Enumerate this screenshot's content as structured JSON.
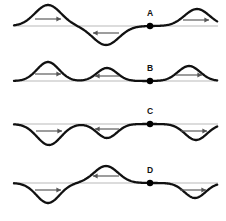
{
  "figure": {
    "title": "",
    "width": 226,
    "height": 221,
    "background_color": "#ffffff",
    "wave_color": "#111111",
    "axis_color": "#b9b9b9",
    "arrow_color": "#555555",
    "marker_color": "#000000"
  },
  "chart_data": {
    "type": "line",
    "title": "",
    "subtitle": "",
    "xlabel": "",
    "ylabel": "",
    "grid": false,
    "legend": null,
    "xlim": [
      0,
      226
    ],
    "ylim": [
      0,
      221
    ],
    "rows": [
      {
        "label": "A",
        "baseline_y": 26,
        "marker": {
          "x": 150,
          "y": 26,
          "label_x": 150,
          "label_y": 16
        },
        "pulses": [
          {
            "center_x": 48,
            "amplitude": 21,
            "direction": "up",
            "half_width": 26,
            "arrow": {
              "direction": "right",
              "x": 48,
              "y": 19,
              "length": 26
            }
          },
          {
            "center_x": 106,
            "amplitude": 19,
            "direction": "down",
            "half_width": 26,
            "arrow": {
              "direction": "left",
              "x": 106,
              "y": 33,
              "length": 26
            }
          },
          {
            "center_x": 197,
            "amplitude": 17,
            "direction": "up",
            "half_width": 25,
            "arrow": {
              "direction": "right",
              "x": 196,
              "y": 20,
              "length": 26
            }
          }
        ]
      },
      {
        "label": "B",
        "baseline_y": 81,
        "marker": {
          "x": 150,
          "y": 81,
          "label_x": 150,
          "label_y": 71
        },
        "pulses": [
          {
            "center_x": 48,
            "amplitude": 19,
            "direction": "up",
            "half_width": 22,
            "arrow": {
              "direction": "right",
              "x": 48,
              "y": 74,
              "length": 26
            }
          },
          {
            "center_x": 107,
            "amplitude": 13,
            "direction": "up",
            "half_width": 20,
            "arrow": {
              "direction": "left",
              "x": 107,
              "y": 76,
              "length": 24
            }
          },
          {
            "center_x": 189,
            "amplitude": 15,
            "direction": "up",
            "half_width": 22,
            "arrow": {
              "direction": "right",
              "x": 189,
              "y": 75,
              "length": 26
            }
          }
        ]
      },
      {
        "label": "C",
        "baseline_y": 124,
        "marker": {
          "x": 150,
          "y": 124,
          "label_x": 150,
          "label_y": 114
        },
        "pulses": [
          {
            "center_x": 49,
            "amplitude": 21,
            "direction": "down",
            "half_width": 24,
            "arrow": {
              "direction": "right",
              "x": 49,
              "y": 131,
              "length": 26
            }
          },
          {
            "center_x": 107,
            "amplitude": 14,
            "direction": "down",
            "half_width": 20,
            "arrow": {
              "direction": "left",
              "x": 107,
              "y": 129,
              "length": 24
            }
          },
          {
            "center_x": 196,
            "amplitude": 16,
            "direction": "down",
            "half_width": 22,
            "arrow": {
              "direction": "right",
              "x": 194,
              "y": 131,
              "length": 26
            }
          }
        ]
      },
      {
        "label": "D",
        "baseline_y": 183,
        "marker": {
          "x": 150,
          "y": 183,
          "label_x": 150,
          "label_y": 173
        },
        "pulses": [
          {
            "center_x": 48,
            "amplitude": 20,
            "direction": "down",
            "half_width": 23,
            "arrow": {
              "direction": "right",
              "x": 48,
              "y": 190,
              "length": 26
            }
          },
          {
            "center_x": 106,
            "amplitude": 17,
            "direction": "up",
            "half_width": 24,
            "arrow": {
              "direction": "left",
              "x": 106,
              "y": 176,
              "length": 26
            }
          },
          {
            "center_x": 195,
            "amplitude": 15,
            "direction": "down",
            "half_width": 21,
            "arrow": {
              "direction": "right",
              "x": 193,
              "y": 190,
              "length": 26
            }
          }
        ]
      }
    ]
  }
}
